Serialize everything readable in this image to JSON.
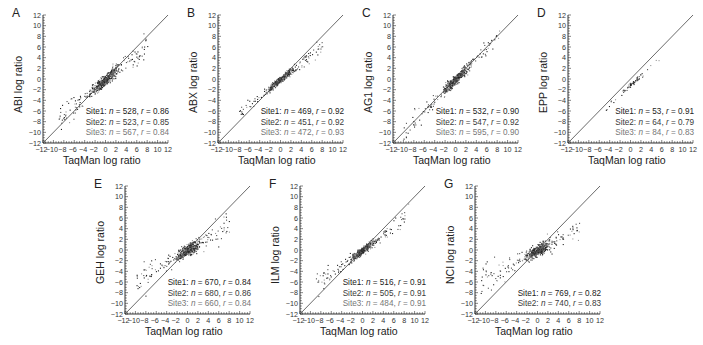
{
  "figure": {
    "x_label": "TaqMan log ratio",
    "x_ticks": [
      -12,
      -10,
      -8,
      -6,
      -4,
      -2,
      0,
      2,
      4,
      6,
      8,
      10,
      12
    ],
    "y_ticks": [
      12,
      10,
      8,
      6,
      4,
      2,
      0,
      -2,
      -4,
      -6,
      -8,
      -10,
      -12
    ]
  },
  "chart_data": [
    {
      "type": "scatter",
      "panel": "A",
      "title": "A",
      "xlabel": "TaqMan log ratio",
      "ylabel": "ABI log ratio",
      "xlim": [
        -12,
        12
      ],
      "ylim": [
        -12,
        12
      ],
      "identity_line": true,
      "grid": false,
      "legend": [
        {
          "site": "Site1",
          "n": 528,
          "r": 0.86
        },
        {
          "site": "Site2",
          "n": 523,
          "r": 0.85
        },
        {
          "site": "Site3",
          "n": 567,
          "r": 0.84
        }
      ],
      "cluster": {
        "center": [
          0,
          0
        ],
        "slope": 0.85,
        "spread": 1.2,
        "scatter_extent": [
          -9,
          8
        ],
        "offset_bias": "points above line at low x, below at high x"
      }
    },
    {
      "type": "scatter",
      "panel": "B",
      "title": "B",
      "xlabel": "TaqMan log ratio",
      "ylabel": "ABX log ratio",
      "xlim": [
        -12,
        12
      ],
      "ylim": [
        -12,
        12
      ],
      "identity_line": true,
      "grid": false,
      "legend": [
        {
          "site": "Site1",
          "n": 469,
          "r": 0.92
        },
        {
          "site": "Site2",
          "n": 451,
          "r": 0.92
        },
        {
          "site": "Site3",
          "n": 472,
          "r": 0.93
        }
      ],
      "cluster": {
        "center": [
          0,
          0
        ],
        "slope": 0.8,
        "spread": 0.7,
        "scatter_extent": [
          -8,
          8
        ]
      }
    },
    {
      "type": "scatter",
      "panel": "C",
      "title": "C",
      "xlabel": "TaqMan log ratio",
      "ylabel": "AG1 log ratio",
      "xlim": [
        -12,
        12
      ],
      "ylim": [
        -12,
        12
      ],
      "identity_line": true,
      "grid": false,
      "legend": [
        {
          "site": "Site1",
          "n": 532,
          "r": 0.9
        },
        {
          "site": "Site2",
          "n": 547,
          "r": 0.92
        },
        {
          "site": "Site3",
          "n": 595,
          "r": 0.9
        }
      ],
      "cluster": {
        "center": [
          0,
          0
        ],
        "slope": 0.95,
        "spread": 1.0,
        "scatter_extent": [
          -10,
          9
        ]
      }
    },
    {
      "type": "scatter",
      "panel": "D",
      "title": "D",
      "xlabel": "TaqMan log ratio",
      "ylabel": "EPP log ratio",
      "xlim": [
        -12,
        12
      ],
      "ylim": [
        -12,
        12
      ],
      "identity_line": true,
      "grid": false,
      "legend": [
        {
          "site": "Site1",
          "n": 53,
          "r": 0.91
        },
        {
          "site": "Site2",
          "n": 64,
          "r": 0.79
        },
        {
          "site": "Site3",
          "n": 84,
          "r": 0.83
        }
      ],
      "cluster": {
        "center": [
          0,
          -1
        ],
        "slope": 0.9,
        "spread": 0.6,
        "scatter_extent": [
          -6,
          6
        ]
      }
    },
    {
      "type": "scatter",
      "panel": "E",
      "title": "E",
      "xlabel": "TaqMan log ratio",
      "ylabel": "GEH log ratio",
      "xlim": [
        -12,
        12
      ],
      "ylim": [
        -12,
        12
      ],
      "identity_line": true,
      "grid": false,
      "legend": [
        {
          "site": "Site1",
          "n": 670,
          "r": 0.84
        },
        {
          "site": "Site2",
          "n": 680,
          "r": 0.86
        },
        {
          "site": "Site3",
          "n": 660,
          "r": 0.84
        }
      ],
      "cluster": {
        "center": [
          0,
          0
        ],
        "slope": 0.6,
        "spread": 1.3,
        "scatter_extent": [
          -10,
          8
        ]
      }
    },
    {
      "type": "scatter",
      "panel": "F",
      "title": "F",
      "xlabel": "TaqMan log ratio",
      "ylabel": "ILM log ratio",
      "xlim": [
        -12,
        12
      ],
      "ylim": [
        -12,
        12
      ],
      "identity_line": true,
      "grid": false,
      "legend": [
        {
          "site": "Site1",
          "n": 516,
          "r": 0.91
        },
        {
          "site": "Site2",
          "n": 505,
          "r": 0.91
        },
        {
          "site": "Site3",
          "n": 484,
          "r": 0.91
        }
      ],
      "cluster": {
        "center": [
          0,
          0
        ],
        "slope": 0.75,
        "spread": 0.8,
        "scatter_extent": [
          -9,
          9
        ]
      }
    },
    {
      "type": "scatter",
      "panel": "G",
      "title": "G",
      "xlabel": "TaqMan log ratio",
      "ylabel": "NCI log ratio",
      "xlim": [
        -12,
        12
      ],
      "ylim": [
        -12,
        12
      ],
      "identity_line": true,
      "grid": false,
      "legend": [
        {
          "site": "Site1",
          "n": 769,
          "r": 0.82
        },
        {
          "site": "Site2",
          "n": 740,
          "r": 0.83
        }
      ],
      "cluster": {
        "center": [
          0,
          0
        ],
        "slope": 0.5,
        "spread": 1.2,
        "scatter_extent": [
          -11,
          8
        ]
      }
    }
  ]
}
